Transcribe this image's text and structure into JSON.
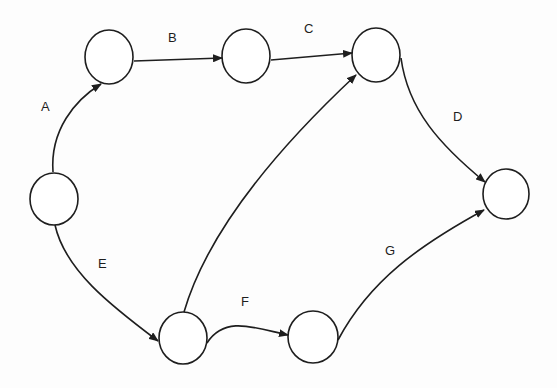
{
  "diagram": {
    "type": "activity-on-arrow network",
    "nodes": [
      {
        "id": "n1",
        "cx": 54,
        "cy": 199
      },
      {
        "id": "n2",
        "cx": 109,
        "cy": 57
      },
      {
        "id": "n3",
        "cx": 246,
        "cy": 56
      },
      {
        "id": "n4",
        "cx": 376,
        "cy": 55
      },
      {
        "id": "n5",
        "cx": 506,
        "cy": 194
      },
      {
        "id": "n6",
        "cx": 183,
        "cy": 338
      },
      {
        "id": "n7",
        "cx": 313,
        "cy": 337
      }
    ],
    "edges": [
      {
        "label": "A",
        "from": "n1",
        "to": "n2"
      },
      {
        "label": "B",
        "from": "n2",
        "to": "n3"
      },
      {
        "label": "C",
        "from": "n3",
        "to": "n4"
      },
      {
        "label": "D",
        "from": "n4",
        "to": "n5"
      },
      {
        "label": "E",
        "from": "n1",
        "to": "n6"
      },
      {
        "label": "F",
        "from": "n6",
        "to": "n7"
      },
      {
        "label": "G",
        "from": "n7",
        "to": "n5"
      },
      {
        "label": "",
        "from": "n6",
        "to": "n4"
      }
    ],
    "labels": {
      "a": "A",
      "b": "B",
      "c": "C",
      "d": "D",
      "e": "E",
      "f": "F",
      "g": "G"
    }
  }
}
